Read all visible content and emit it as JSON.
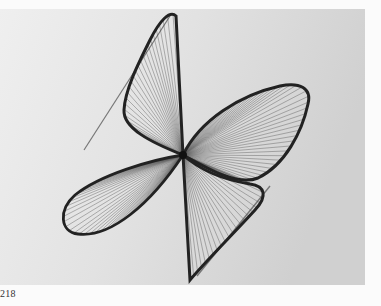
{
  "page": {
    "page_number": "218"
  },
  "photo": {
    "subject": "string-sculpture",
    "background_left": "#ececec",
    "background_right": "#d2d2d2",
    "frame_color": "#2a2a2a",
    "string_color": "#3a3a3a"
  }
}
